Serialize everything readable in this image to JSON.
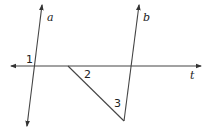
{
  "diagram": {
    "title": "",
    "lines": [
      {
        "id": "a",
        "label": "a",
        "type": "line"
      },
      {
        "id": "b",
        "label": "b",
        "type": "line"
      },
      {
        "id": "t",
        "label": "t",
        "type": "transversal"
      }
    ],
    "angles": [
      {
        "id": "1",
        "label": "1"
      },
      {
        "id": "2",
        "label": "2"
      },
      {
        "id": "3",
        "label": "3"
      }
    ],
    "colors": {
      "stroke": "#444444",
      "text": "#222222",
      "background": "#ffffff"
    }
  }
}
